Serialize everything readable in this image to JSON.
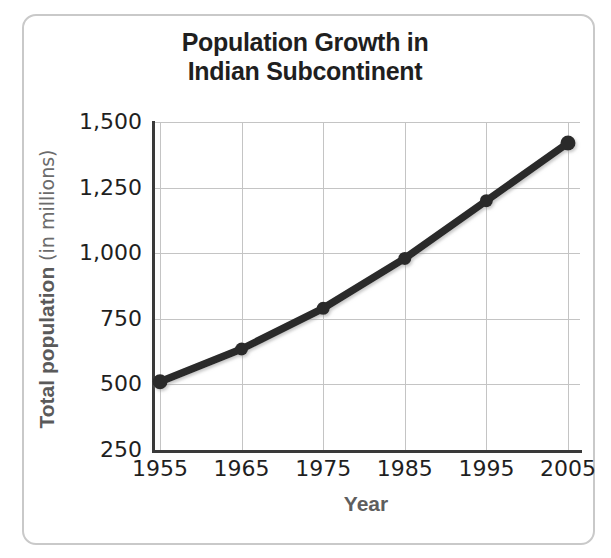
{
  "chart_data": {
    "type": "line",
    "title": "Population Growth in Indian Subcontinent",
    "title_lines": [
      "Population Growth in",
      "Indian Subcontinent"
    ],
    "xlabel": "Year",
    "ylabel_bold": "Total population",
    "ylabel_thin": "(in millions)",
    "ylabel_full": "Total population (in millions)",
    "x": [
      1955,
      1965,
      1975,
      1985,
      1995,
      2005
    ],
    "xtick_labels": [
      "1955",
      "1965",
      "1975",
      "1985",
      "1995",
      "2005"
    ],
    "values": [
      510,
      635,
      790,
      980,
      1200,
      1420
    ],
    "series": [
      {
        "name": "Total population",
        "values": [
          510,
          635,
          790,
          980,
          1200,
          1420
        ]
      }
    ],
    "yticks": [
      250,
      500,
      750,
      1000,
      1250,
      1500
    ],
    "ytick_labels": [
      "250",
      "500",
      "750",
      "1,000",
      "1,250",
      "1,500"
    ],
    "ylim": [
      250,
      1500
    ],
    "xlim": [
      1955,
      2005
    ],
    "grid": true,
    "legend": "none",
    "line_color": "#2b2b2b",
    "marker_color": "#2b2b2b",
    "grid_color": "#c4c4c4",
    "axis_color": "#3a3a3a",
    "title_color": "#1f1f1f",
    "axis_label_color": "#5e5e5e",
    "frame_color": "#c9c9c9",
    "background_color": "#ffffff"
  }
}
